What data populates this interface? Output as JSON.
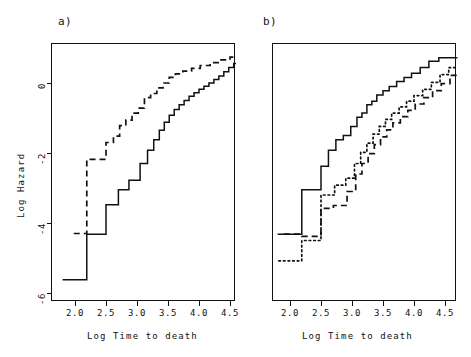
{
  "figure": {
    "width": 471,
    "height": 357,
    "background": "#ffffff",
    "ink": "#111111"
  },
  "panels": [
    {
      "key": "a",
      "label": "a)",
      "xlabel": "Log Time to death",
      "ylabel": "Log Hazard"
    },
    {
      "key": "b",
      "label": "b)",
      "xlabel": "Log Time to death",
      "ylabel": ""
    }
  ],
  "axes": {
    "x_ticks": [
      "2.0",
      "2.5",
      "3.0",
      "3.5",
      "4.0",
      "4.5"
    ],
    "y_ticks": [
      "0",
      "-2",
      "-4",
      "-6"
    ],
    "xlim": [
      1.78,
      4.72
    ],
    "ylim": [
      -6.55,
      1.05
    ],
    "grid": false,
    "frame": true
  },
  "chart_data": {
    "type": "line",
    "title": "",
    "xlabel": "Log Time to death",
    "ylabel": "Log Hazard",
    "xlim": [
      1.78,
      4.72
    ],
    "ylim": [
      -6.55,
      1.05
    ],
    "x_ticks": [
      2.0,
      2.5,
      3.0,
      3.5,
      4.0,
      4.5
    ],
    "y_ticks": [
      0,
      -2,
      -4,
      -6
    ],
    "grid": false,
    "legend": "none",
    "step_interpolation": "hv",
    "panels": [
      {
        "key": "a",
        "label": "a)",
        "series": [
          {
            "name": "solid-curve-a",
            "style": "solid",
            "color": "#111111",
            "points": [
              [
                1.8,
                -5.62
              ],
              [
                2.19,
                -5.62
              ],
              [
                2.19,
                -4.32
              ],
              [
                2.5,
                -4.32
              ],
              [
                2.5,
                -3.48
              ],
              [
                2.7,
                -3.48
              ],
              [
                2.7,
                -3.05
              ],
              [
                2.87,
                -3.05
              ],
              [
                2.87,
                -2.78
              ],
              [
                3.05,
                -2.78
              ],
              [
                3.05,
                -2.3
              ],
              [
                3.17,
                -2.3
              ],
              [
                3.17,
                -1.92
              ],
              [
                3.27,
                -1.92
              ],
              [
                3.27,
                -1.62
              ],
              [
                3.36,
                -1.62
              ],
              [
                3.36,
                -1.35
              ],
              [
                3.44,
                -1.35
              ],
              [
                3.44,
                -1.12
              ],
              [
                3.52,
                -1.12
              ],
              [
                3.52,
                -0.92
              ],
              [
                3.6,
                -0.92
              ],
              [
                3.6,
                -0.76
              ],
              [
                3.68,
                -0.76
              ],
              [
                3.68,
                -0.62
              ],
              [
                3.76,
                -0.62
              ],
              [
                3.76,
                -0.5
              ],
              [
                3.84,
                -0.5
              ],
              [
                3.84,
                -0.38
              ],
              [
                3.92,
                -0.38
              ],
              [
                3.92,
                -0.28
              ],
              [
                4.0,
                -0.28
              ],
              [
                4.0,
                -0.18
              ],
              [
                4.08,
                -0.18
              ],
              [
                4.08,
                -0.09
              ],
              [
                4.16,
                -0.09
              ],
              [
                4.16,
                0.0
              ],
              [
                4.24,
                0.0
              ],
              [
                4.24,
                0.1
              ],
              [
                4.32,
                0.1
              ],
              [
                4.32,
                0.2
              ],
              [
                4.4,
                0.2
              ],
              [
                4.4,
                0.32
              ],
              [
                4.48,
                0.32
              ],
              [
                4.48,
                0.44
              ],
              [
                4.56,
                0.44
              ],
              [
                4.56,
                0.56
              ],
              [
                4.64,
                0.56
              ],
              [
                4.64,
                0.66
              ],
              [
                4.7,
                0.66
              ]
            ]
          },
          {
            "name": "dashed-curve-a",
            "style": "dashed",
            "color": "#111111",
            "points": [
              [
                1.98,
                -4.3
              ],
              [
                2.19,
                -4.3
              ],
              [
                2.19,
                -2.18
              ],
              [
                2.5,
                -2.18
              ],
              [
                2.5,
                -1.7
              ],
              [
                2.62,
                -1.7
              ],
              [
                2.62,
                -1.52
              ],
              [
                2.72,
                -1.52
              ],
              [
                2.72,
                -1.22
              ],
              [
                2.82,
                -1.22
              ],
              [
                2.82,
                -1.06
              ],
              [
                2.92,
                -1.06
              ],
              [
                2.92,
                -0.86
              ],
              [
                3.02,
                -0.86
              ],
              [
                3.02,
                -0.72
              ],
              [
                3.12,
                -0.72
              ],
              [
                3.12,
                -0.42
              ],
              [
                3.22,
                -0.42
              ],
              [
                3.22,
                -0.3
              ],
              [
                3.32,
                -0.3
              ],
              [
                3.32,
                -0.14
              ],
              [
                3.42,
                -0.14
              ],
              [
                3.42,
                0.0
              ],
              [
                3.52,
                0.0
              ],
              [
                3.52,
                0.16
              ],
              [
                3.62,
                0.16
              ],
              [
                3.62,
                0.26
              ],
              [
                3.74,
                0.26
              ],
              [
                3.74,
                0.34
              ],
              [
                3.88,
                0.34
              ],
              [
                3.88,
                0.42
              ],
              [
                4.02,
                0.42
              ],
              [
                4.02,
                0.5
              ],
              [
                4.18,
                0.5
              ],
              [
                4.18,
                0.58
              ],
              [
                4.34,
                0.58
              ],
              [
                4.34,
                0.66
              ],
              [
                4.5,
                0.66
              ],
              [
                4.5,
                0.74
              ],
              [
                4.64,
                0.74
              ],
              [
                4.64,
                0.8
              ],
              [
                4.7,
                0.8
              ]
            ]
          }
        ]
      },
      {
        "key": "b",
        "label": "b)",
        "series": [
          {
            "name": "solid-curve-b",
            "style": "solid",
            "color": "#111111",
            "points": [
              [
                1.8,
                -4.32
              ],
              [
                2.19,
                -4.32
              ],
              [
                2.19,
                -3.05
              ],
              [
                2.5,
                -3.05
              ],
              [
                2.5,
                -2.38
              ],
              [
                2.62,
                -2.38
              ],
              [
                2.62,
                -1.92
              ],
              [
                2.74,
                -1.92
              ],
              [
                2.74,
                -1.62
              ],
              [
                2.86,
                -1.62
              ],
              [
                2.86,
                -1.5
              ],
              [
                2.98,
                -1.5
              ],
              [
                2.98,
                -1.24
              ],
              [
                3.08,
                -1.24
              ],
              [
                3.08,
                -0.98
              ],
              [
                3.16,
                -0.98
              ],
              [
                3.16,
                -0.86
              ],
              [
                3.24,
                -0.86
              ],
              [
                3.24,
                -0.62
              ],
              [
                3.32,
                -0.62
              ],
              [
                3.32,
                -0.52
              ],
              [
                3.4,
                -0.52
              ],
              [
                3.4,
                -0.34
              ],
              [
                3.5,
                -0.34
              ],
              [
                3.5,
                -0.22
              ],
              [
                3.6,
                -0.22
              ],
              [
                3.6,
                -0.1
              ],
              [
                3.72,
                -0.1
              ],
              [
                3.72,
                0.04
              ],
              [
                3.84,
                0.04
              ],
              [
                3.84,
                0.16
              ],
              [
                3.96,
                0.16
              ],
              [
                3.96,
                0.28
              ],
              [
                4.1,
                0.28
              ],
              [
                4.1,
                0.44
              ],
              [
                4.24,
                0.44
              ],
              [
                4.24,
                0.62
              ],
              [
                4.4,
                0.62
              ],
              [
                4.4,
                0.72
              ],
              [
                4.7,
                0.72
              ]
            ]
          },
          {
            "name": "dashed-curve-b",
            "style": "dashed",
            "color": "#111111",
            "points": [
              [
                1.9,
                -4.32
              ],
              [
                2.19,
                -4.32
              ],
              [
                2.19,
                -4.38
              ],
              [
                2.5,
                -4.38
              ],
              [
                2.5,
                -3.58
              ],
              [
                2.7,
                -3.58
              ],
              [
                2.7,
                -3.5
              ],
              [
                2.92,
                -3.5
              ],
              [
                2.92,
                -3.1
              ],
              [
                3.06,
                -3.1
              ],
              [
                3.06,
                -2.6
              ],
              [
                3.16,
                -2.6
              ],
              [
                3.16,
                -2.3
              ],
              [
                3.26,
                -2.3
              ],
              [
                3.26,
                -2.02
              ],
              [
                3.36,
                -2.02
              ],
              [
                3.36,
                -1.76
              ],
              [
                3.46,
                -1.76
              ],
              [
                3.46,
                -1.54
              ],
              [
                3.56,
                -1.54
              ],
              [
                3.56,
                -1.34
              ],
              [
                3.66,
                -1.34
              ],
              [
                3.66,
                -1.14
              ],
              [
                3.78,
                -1.14
              ],
              [
                3.78,
                -0.96
              ],
              [
                3.9,
                -0.96
              ],
              [
                3.9,
                -0.78
              ],
              [
                4.02,
                -0.78
              ],
              [
                4.02,
                -0.6
              ],
              [
                4.16,
                -0.6
              ],
              [
                4.16,
                -0.42
              ],
              [
                4.3,
                -0.42
              ],
              [
                4.3,
                -0.22
              ],
              [
                4.44,
                -0.22
              ],
              [
                4.44,
                -0.02
              ],
              [
                4.58,
                -0.02
              ],
              [
                4.58,
                0.22
              ],
              [
                4.7,
                0.22
              ]
            ]
          },
          {
            "name": "dotted-curve-b",
            "style": "dotted",
            "color": "#111111",
            "points": [
              [
                1.82,
                -5.08
              ],
              [
                2.19,
                -5.08
              ],
              [
                2.19,
                -4.5
              ],
              [
                2.5,
                -4.5
              ],
              [
                2.5,
                -3.2
              ],
              [
                2.72,
                -3.2
              ],
              [
                2.72,
                -2.92
              ],
              [
                2.9,
                -2.92
              ],
              [
                2.9,
                -2.72
              ],
              [
                3.04,
                -2.72
              ],
              [
                3.04,
                -2.3
              ],
              [
                3.14,
                -2.3
              ],
              [
                3.14,
                -1.98
              ],
              [
                3.24,
                -1.98
              ],
              [
                3.24,
                -1.72
              ],
              [
                3.34,
                -1.72
              ],
              [
                3.34,
                -1.46
              ],
              [
                3.44,
                -1.46
              ],
              [
                3.44,
                -1.24
              ],
              [
                3.54,
                -1.24
              ],
              [
                3.54,
                -1.04
              ],
              [
                3.64,
                -1.04
              ],
              [
                3.64,
                -0.86
              ],
              [
                3.76,
                -0.86
              ],
              [
                3.76,
                -0.68
              ],
              [
                3.88,
                -0.68
              ],
              [
                3.88,
                -0.52
              ],
              [
                4.0,
                -0.52
              ],
              [
                4.0,
                -0.36
              ],
              [
                4.14,
                -0.36
              ],
              [
                4.14,
                -0.18
              ],
              [
                4.28,
                -0.18
              ],
              [
                4.28,
                0.02
              ],
              [
                4.42,
                0.02
              ],
              [
                4.42,
                0.24
              ],
              [
                4.56,
                0.24
              ],
              [
                4.56,
                0.44
              ],
              [
                4.7,
                0.44
              ]
            ]
          }
        ]
      }
    ]
  }
}
